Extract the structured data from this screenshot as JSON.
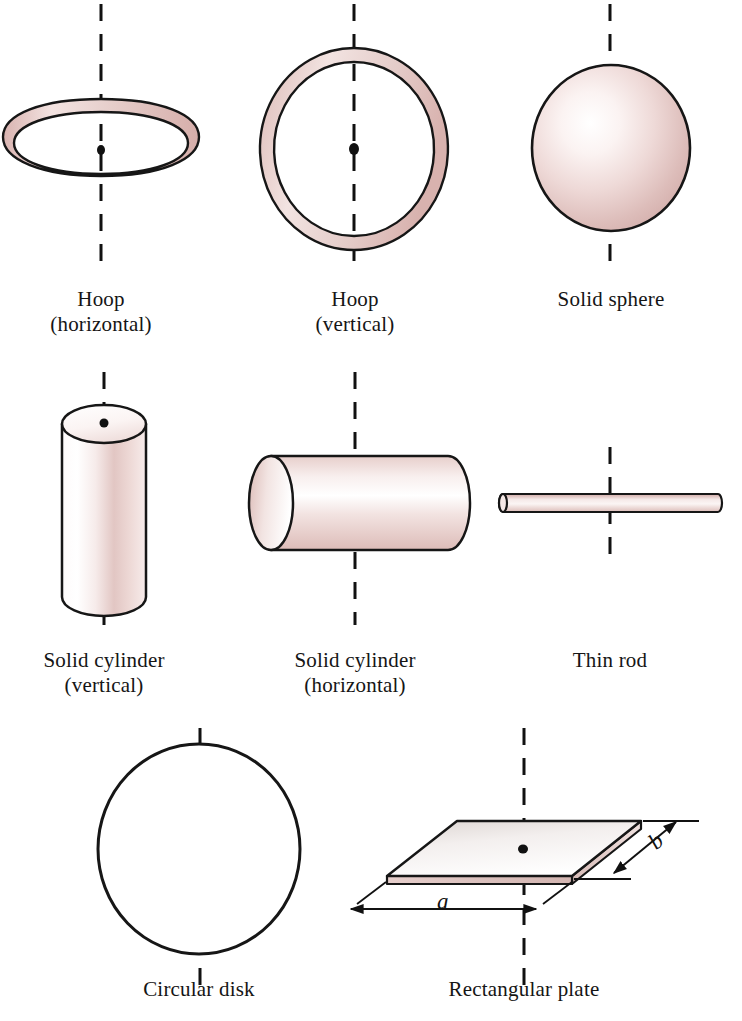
{
  "figure": {
    "background_color": "#ffffff",
    "outline_color": "#161616",
    "body_tint": "#e8d3d1",
    "body_tint_dark": "#cfa9a6",
    "body_tint_light": "#fdf8f7",
    "axis_color": "#111111",
    "text_color": "#151515"
  },
  "rows": [
    {
      "items": [
        {
          "id": "hoop-horizontal",
          "label_line1": "Hoop",
          "label_line2": "(horizontal)"
        },
        {
          "id": "hoop-vertical",
          "label_line1": "Hoop",
          "label_line2": "(vertical)"
        },
        {
          "id": "solid-sphere",
          "label_line1": "Solid sphere",
          "label_line2": ""
        }
      ]
    },
    {
      "items": [
        {
          "id": "solid-cylinder-vertical",
          "label_line1": "Solid cylinder",
          "label_line2": "(vertical)"
        },
        {
          "id": "solid-cylinder-horizontal",
          "label_line1": "Solid cylinder",
          "label_line2": "(horizontal)"
        },
        {
          "id": "thin-rod",
          "label_line1": "Thin rod",
          "label_line2": ""
        }
      ]
    },
    {
      "items": [
        {
          "id": "circular-disk",
          "label_line1": "Circular disk",
          "label_line2": ""
        },
        {
          "id": "rectangular-plate",
          "label_line1": "Rectangular plate",
          "label_line2": ""
        }
      ]
    }
  ],
  "dimension_labels": {
    "plate_width": "a",
    "plate_depth": "b"
  },
  "captions": {
    "hoop_horizontal_1": "Hoop",
    "hoop_horizontal_2": "(horizontal)",
    "hoop_vertical_1": "Hoop",
    "hoop_vertical_2": "(vertical)",
    "solid_sphere": "Solid sphere",
    "solid_cylinder_vertical_1": "Solid cylinder",
    "solid_cylinder_vertical_2": "(vertical)",
    "solid_cylinder_horizontal_1": "Solid cylinder",
    "solid_cylinder_horizontal_2": "(horizontal)",
    "thin_rod": "Thin rod",
    "circular_disk": "Circular disk",
    "rectangular_plate": "Rectangular plate"
  }
}
